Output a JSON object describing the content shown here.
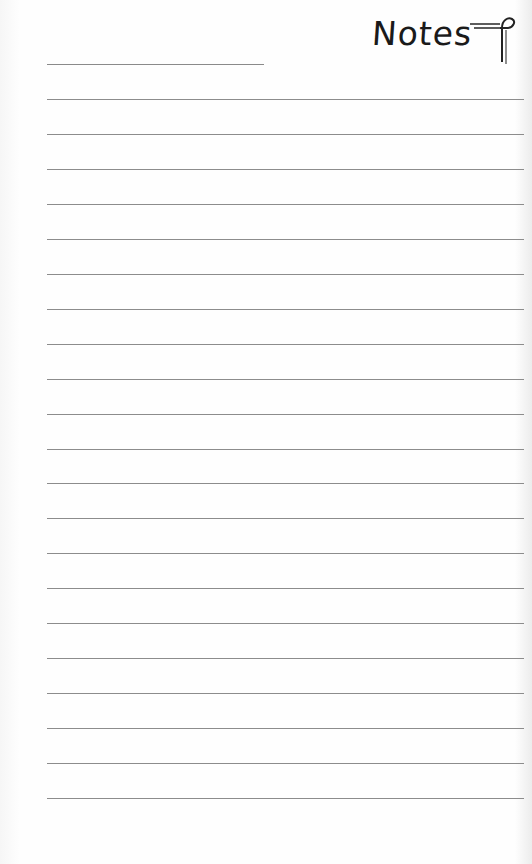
{
  "header": {
    "title": "Notes",
    "icon": "pilcrow-icon",
    "name_line_blank": ""
  },
  "ruled_lines": {
    "count": 21,
    "first_y": 99,
    "spacing": 34.95,
    "color": "#8c8c8c"
  },
  "colors": {
    "paper": "#fdfdfd",
    "ink": "#1a1a1a"
  }
}
